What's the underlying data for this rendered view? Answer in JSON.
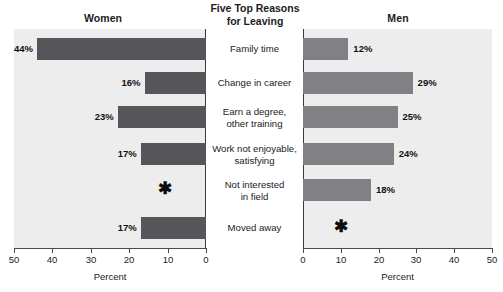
{
  "header": {
    "center_title_line1": "Five Top Reasons",
    "center_title_line2": "for Leaving",
    "left_title": "Women",
    "right_title": "Men"
  },
  "axis": {
    "left_label": "Percent",
    "right_label": "Percent",
    "left_ticks": [
      "50",
      "40",
      "30",
      "20",
      "10",
      "0"
    ],
    "right_ticks": [
      "0",
      "10",
      "20",
      "30",
      "40",
      "50"
    ]
  },
  "markers": {
    "suppressed_symbol": "✱"
  },
  "colors": {
    "women_bar": "#55555a",
    "men_bar": "#808085",
    "panel_background": "#ededed",
    "center_background": "#ffffff",
    "axis": "#4a4a4a",
    "text": "#1b1b1b"
  },
  "categories": [
    {
      "line1": "Family time",
      "line2": ""
    },
    {
      "line1": "Change in career",
      "line2": ""
    },
    {
      "line1": "Earn a degree,",
      "line2": "other training"
    },
    {
      "line1": "Work not enjoyable,",
      "line2": "satisfying"
    },
    {
      "line1": "Not interested",
      "line2": "in field"
    },
    {
      "line1": "Moved away",
      "line2": ""
    }
  ],
  "women_labels": [
    "44%",
    "16%",
    "23%",
    "17%",
    "✱",
    "17%"
  ],
  "men_labels": [
    "12%",
    "29%",
    "25%",
    "24%",
    "18%",
    "✱"
  ],
  "chart_data": {
    "type": "bar",
    "title": "Five Top Reasons for Leaving",
    "orientation": "horizontal",
    "layout": "back-to-back paired panels, shared centered category labels",
    "xlabel": "Percent",
    "ylabel": "",
    "xlim": [
      0,
      50
    ],
    "grid": false,
    "legend": null,
    "categories": [
      "Family time",
      "Change in career",
      "Earn a degree, other training",
      "Work not enjoyable, satisfying",
      "Not interested in field",
      "Moved away"
    ],
    "series": [
      {
        "name": "Women",
        "panel": "left",
        "axis_direction": "right-to-left",
        "axis_ticks": [
          50,
          40,
          30,
          20,
          10,
          0
        ],
        "color": "#55555a",
        "values": [
          44,
          16,
          23,
          17,
          null,
          17
        ],
        "data_labels": [
          "44%",
          "16%",
          "23%",
          "17%",
          "*",
          "17%"
        ]
      },
      {
        "name": "Men",
        "panel": "right",
        "axis_direction": "left-to-right",
        "axis_ticks": [
          0,
          10,
          20,
          30,
          40,
          50
        ],
        "color": "#808085",
        "values": [
          12,
          29,
          25,
          24,
          18,
          null
        ],
        "data_labels": [
          "12%",
          "29%",
          "25%",
          "24%",
          "18%",
          "*"
        ]
      }
    ],
    "annotations": [
      {
        "panel": "left",
        "category": "Not interested in field",
        "symbol": "*",
        "meaning": "value not shown / suppressed"
      },
      {
        "panel": "right",
        "category": "Moved away",
        "symbol": "*",
        "meaning": "value not shown / suppressed"
      }
    ]
  }
}
